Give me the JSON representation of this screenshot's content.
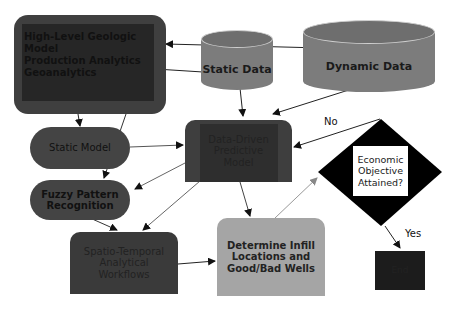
{
  "diagram": {
    "nodes": {
      "geologic": {
        "label": "High-Level Geologic Model\nProduction Analytics\nGeoanalytics",
        "shape": "rounded-rect",
        "color": "#3f3f3f"
      },
      "static_data": {
        "label": "Static Data",
        "shape": "cylinder",
        "color": "#7c7c7c"
      },
      "dynamic_data": {
        "label": "Dynamic Data",
        "shape": "cylinder",
        "color": "#7c7c7c"
      },
      "static_model": {
        "label": "Static Model",
        "shape": "stadium",
        "color": "#444444"
      },
      "fuzzy": {
        "label": "Fuzzy Pattern\nRecognition",
        "shape": "stadium",
        "color": "#444444"
      },
      "ddpm": {
        "label": "Data-Driven\nPredictive\nModel",
        "shape": "rounded-top-rect",
        "color": "#3e3e3e"
      },
      "spatio": {
        "label": "Spatio-Temporal\nAnalytical\nWorkflows",
        "shape": "rounded-top-rect",
        "color": "#3a3a3a"
      },
      "infill": {
        "label": "Determine Infill\nLocations and\nGood/Bad Wells",
        "shape": "rounded-top-rect",
        "color": "#a5a5a5"
      },
      "decision": {
        "label": "Economic\nObjective\nAttained?",
        "shape": "diamond",
        "color": "#000000"
      },
      "end": {
        "label": "End",
        "shape": "rect",
        "color": "#1c1c1c"
      }
    },
    "edge_labels": {
      "no": "No",
      "yes": "Yes"
    },
    "edges": [
      {
        "from": "dynamic_data",
        "to": "geologic"
      },
      {
        "from": "static_data",
        "to": "geologic"
      },
      {
        "from": "static_data",
        "to": "ddpm"
      },
      {
        "from": "dynamic_data",
        "to": "ddpm"
      },
      {
        "from": "geologic",
        "to": "static_model"
      },
      {
        "from": "geologic",
        "to": "fuzzy"
      },
      {
        "from": "static_model",
        "to": "ddpm"
      },
      {
        "from": "ddpm",
        "to": "fuzzy"
      },
      {
        "from": "ddpm",
        "to": "spatio"
      },
      {
        "from": "fuzzy",
        "to": "spatio"
      },
      {
        "from": "ddpm",
        "to": "infill"
      },
      {
        "from": "spatio",
        "to": "infill"
      },
      {
        "from": "infill",
        "to": "decision"
      },
      {
        "from": "decision",
        "to": "ddpm",
        "label": "No"
      },
      {
        "from": "decision",
        "to": "end",
        "label": "Yes"
      }
    ]
  }
}
